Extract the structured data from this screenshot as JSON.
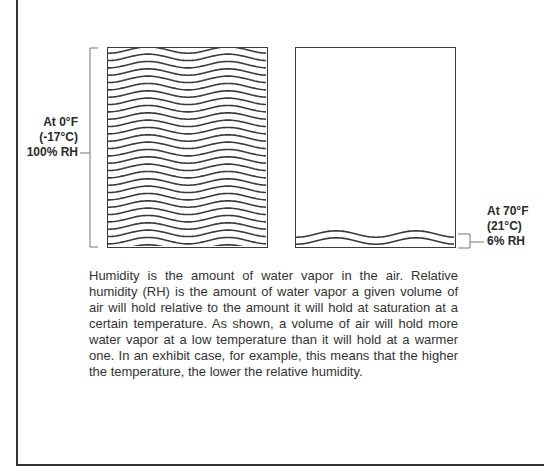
{
  "figure": {
    "cold_container": {
      "temperature_f": "At 0°F",
      "temperature_c": "(-17°C)",
      "humidity": "100% RH",
      "fill_percent": 100,
      "wave_lines": 27
    },
    "warm_container": {
      "temperature_f": "At  70°F",
      "temperature_c": "(21°C)",
      "humidity": "6% RH",
      "fill_percent": 6,
      "wave_lines": 2
    }
  },
  "caption": {
    "text": "Humidity is the amount of water vapor in the air.  Relative humidity (RH) is the amount of water vapor a given volume of air will hold relative to the amount it will hold at saturation at a certain temperature.  As shown, a volume of air will hold more water vapor at a low temperature than it will hold at a warmer one.  In an exhibit case, for example, this means that the higher the temperature, the lower the relative humidity."
  },
  "colors": {
    "line": "#3a3a3a",
    "text": "#2a2a2a",
    "background": "#ffffff"
  }
}
